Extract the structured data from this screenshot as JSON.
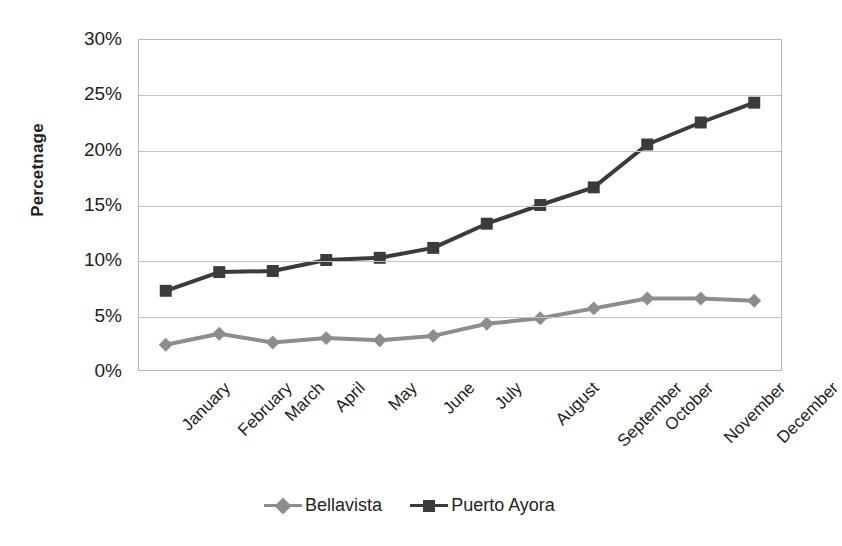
{
  "chart_data": {
    "type": "line",
    "title": "",
    "xlabel": "",
    "ylabel": "Percetnage",
    "categories": [
      "January",
      "February",
      "March",
      "April",
      "May",
      "June",
      "July",
      "August",
      "September",
      "October",
      "November",
      "December"
    ],
    "ylim": [
      0,
      30
    ],
    "ytick_values": [
      0,
      5,
      10,
      15,
      20,
      25,
      30
    ],
    "ytick_labels": [
      "0%",
      "5%",
      "10%",
      "15%",
      "20%",
      "25%",
      "30%"
    ],
    "grid": true,
    "legend_position": "bottom",
    "series": [
      {
        "name": "Bellavista",
        "color": "#8d8d8d",
        "marker": "diamond",
        "values": [
          2.3,
          3.3,
          2.5,
          2.9,
          2.7,
          3.1,
          4.2,
          4.7,
          5.6,
          6.5,
          6.5,
          6.3
        ]
      },
      {
        "name": "Puerto Ayora",
        "color": "#3b3b3b",
        "marker": "square",
        "values": [
          7.2,
          8.9,
          9.0,
          10.0,
          10.2,
          11.1,
          13.3,
          15.0,
          16.6,
          20.5,
          22.5,
          24.3
        ]
      }
    ]
  },
  "colors": {
    "background": "#ffffff",
    "text": "#231f20",
    "gridline": "#c2c2c2",
    "plot_border": "#b9b9b9",
    "series_bellavista": "#8d8d8d",
    "series_puerto_ayora": "#3b3b3b"
  }
}
